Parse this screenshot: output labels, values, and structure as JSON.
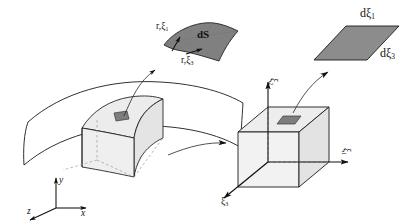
{
  "figure": {
    "background_color": "#ffffff",
    "line_color": "#1a1a1a",
    "surface_fill": "#808080",
    "solid_fill": "#ebebeb",
    "patch_fill": "#8c8c8c",
    "width": 415,
    "height": 222
  },
  "labels": {
    "dS": "dS",
    "tangent_1": "r,ξ",
    "tangent_1_sub": "1",
    "tangent_3": "r,ξ",
    "tangent_3_sub": "3",
    "d_xi_1": "dξ",
    "d_xi_1_sub": "1",
    "d_xi_3": "dξ",
    "d_xi_3_sub": "3",
    "xi_1": "ξ",
    "xi_1_sub": "1",
    "xi_2": "ξ",
    "xi_2_sub": "2",
    "xi_3": "ξ",
    "xi_3_sub": "3",
    "axis_x": "x",
    "axis_y": "y",
    "axis_z": "z"
  },
  "elements": {
    "curved_surface_name": "mid-surface-shell",
    "curved_solid_name": "curved-hexahedral-element",
    "reference_cube_name": "reference-unit-cube",
    "dS_patch_name": "differential-surface-patch",
    "parametric_patch_name": "parametric-surface-parallelogram"
  }
}
